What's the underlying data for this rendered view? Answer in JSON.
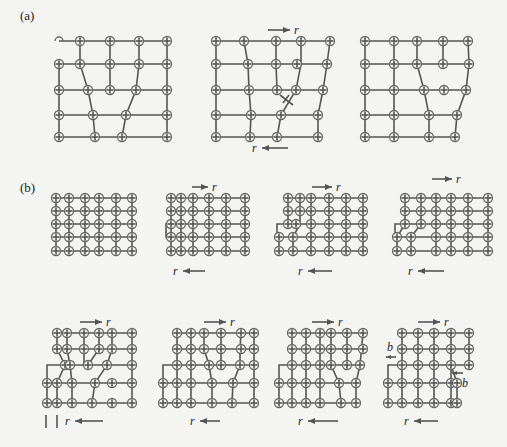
{
  "figure": {
    "panel_a": {
      "label": "(a)",
      "force_symbol": "r",
      "diagrams": [
        {
          "id": "a1",
          "description": "edge dislocation, two extra half-planes"
        },
        {
          "id": "a2",
          "description": "sheared lattice with dislocation symbol",
          "top_arrow": "r",
          "bottom_arrow": "r"
        },
        {
          "id": "a3",
          "description": "dislocation moved"
        }
      ]
    },
    "panel_b": {
      "label": "(b)",
      "force_symbol": "r",
      "burgers_symbol": "b",
      "diagrams": [
        {
          "id": "b1",
          "description": "perfect lattice 6x5"
        },
        {
          "id": "b2",
          "description": "step formed",
          "top_arrow": "r",
          "bottom_arrow": "r"
        },
        {
          "id": "b3",
          "description": "dislocation enters",
          "top_arrow": "r",
          "bottom_arrow": "r"
        },
        {
          "id": "b4",
          "description": "dislocation moves",
          "top_arrow": "r",
          "bottom_arrow": "r"
        },
        {
          "id": "b5",
          "description": "second step",
          "top_arrow": "r",
          "bottom_arrow": "r",
          "marks": "| |"
        },
        {
          "id": "b6",
          "description": "glide continues",
          "top_arrow": "r",
          "bottom_arrow": "r"
        },
        {
          "id": "b7",
          "description": "dislocation near surface",
          "top_arrow": "r",
          "bottom_arrow": "r"
        },
        {
          "id": "b8",
          "description": "slip complete",
          "top_arrow": "r",
          "bottom_arrow": "r",
          "burgers_left": "b",
          "burgers_right": "b"
        }
      ]
    },
    "colors": {
      "line": "#555555",
      "atom": "#666666",
      "text": "#222222",
      "background": "#f4f4f2"
    }
  }
}
